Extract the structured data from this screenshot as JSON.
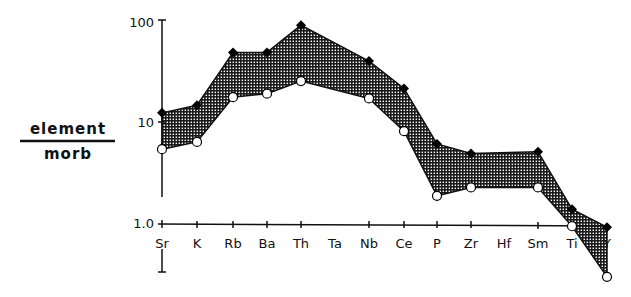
{
  "chart_data": {
    "type": "area",
    "title": "",
    "xlabel": "",
    "ylabel": "element / morb",
    "ylabel_numerator": "element",
    "ylabel_denominator": "morb",
    "yscale": "log",
    "ylim": [
      0.3,
      100
    ],
    "yticks": [
      {
        "value": 100,
        "label": "100"
      },
      {
        "value": 10,
        "label": "10"
      },
      {
        "value": 1,
        "label": "1.0"
      }
    ],
    "categories": [
      "Sr",
      "K",
      "Rb",
      "Ba",
      "Th",
      "Ta",
      "Nb",
      "Ce",
      "P",
      "Zr",
      "Hf",
      "Sm",
      "Ti",
      "Y"
    ],
    "series": [
      {
        "name": "upper bound",
        "marker": "filled-diamond",
        "values": [
          12.6,
          15,
          50,
          50,
          93,
          null,
          41,
          22,
          6.2,
          5,
          null,
          5.2,
          1.4,
          0.93
        ]
      },
      {
        "name": "lower bound",
        "marker": "open-circle",
        "values": [
          5.5,
          6.5,
          18,
          19.5,
          26,
          null,
          17.5,
          8.3,
          1.9,
          2.3,
          null,
          2.3,
          0.95,
          0.3
        ]
      }
    ],
    "fill_between": true,
    "fill_pattern": "crosshatch",
    "grid": false,
    "legend": null
  }
}
